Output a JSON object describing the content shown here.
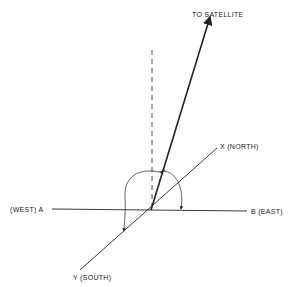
{
  "diagram": {
    "labels": {
      "satellite": "TO SATELLITE",
      "north": "X (NORTH)",
      "south": "Y (SOUTH)",
      "west": "(WEST) A",
      "east": "B (EAST)"
    },
    "colors": {
      "line": "#222222",
      "background": "#ffffff"
    }
  }
}
